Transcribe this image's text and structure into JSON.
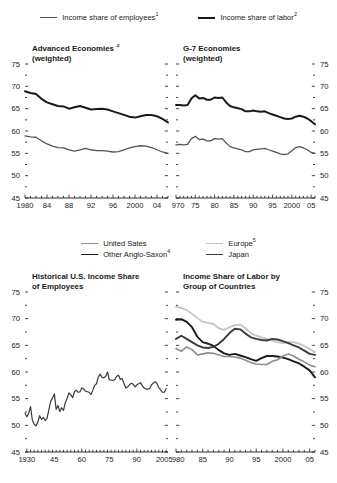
{
  "top_legend": {
    "items": [
      {
        "label": "Income share of employees",
        "sup": "1",
        "color": "#555555",
        "width": 1.3
      },
      {
        "label": "Income share of labor",
        "sup": "2",
        "color": "#1a1a1a",
        "width": 2.0
      }
    ]
  },
  "mid_legend": {
    "items": [
      {
        "label": "United Sates",
        "sup": "",
        "color": "#8c8c8c",
        "width": 1.5
      },
      {
        "label": "Other Anglo-Saxon",
        "sup": "4",
        "color": "#1a1a1a",
        "width": 1.9
      },
      {
        "label": "Europe",
        "sup": "5",
        "color": "#c4c4c4",
        "width": 1.7
      },
      {
        "label": "Japan",
        "sup": "",
        "color": "#3a3a3a",
        "width": 1.9
      }
    ]
  },
  "chart_data": [
    {
      "id": "advanced-economies",
      "type": "line",
      "title": "Advanced Economies",
      "title_sup": "3",
      "subtitle": "(weighted)",
      "labels_side": "left",
      "xlabel": "",
      "ylabel": "",
      "ylim": [
        45,
        75
      ],
      "yticks": [
        45,
        50,
        55,
        60,
        65,
        70,
        75
      ],
      "yticklabels": [
        "45",
        "50",
        "55",
        "60",
        "65",
        "70",
        "75"
      ],
      "yminor_step": 2.5,
      "xlim": [
        1980,
        2006
      ],
      "xticks": [
        1980,
        1984,
        1988,
        1992,
        1996,
        2000,
        2004
      ],
      "xticklabels": [
        "1980",
        "84",
        "88",
        "92",
        "96",
        "2000",
        "04"
      ],
      "xminor_step": 1,
      "grid": false,
      "series": [
        {
          "name": "Income share of labor",
          "color": "#1a1a1a",
          "width": 2.0,
          "x": [
            1980,
            1981,
            1982,
            1983,
            1984,
            1985,
            1986,
            1987,
            1988,
            1989,
            1990,
            1991,
            1992,
            1993,
            1994,
            1995,
            1996,
            1997,
            1998,
            1999,
            2000,
            2001,
            2002,
            2003,
            2004,
            2005,
            2006
          ],
          "values": [
            68.9,
            68.5,
            68.3,
            67.2,
            66.4,
            66.0,
            65.6,
            65.5,
            65.0,
            65.3,
            65.6,
            65.2,
            64.8,
            64.9,
            65.0,
            64.8,
            64.4,
            64.0,
            63.6,
            63.2,
            63.0,
            63.3,
            63.6,
            63.6,
            63.3,
            62.7,
            61.9
          ]
        },
        {
          "name": "Income share of employees",
          "color": "#555555",
          "width": 1.3,
          "x": [
            1980,
            1981,
            1982,
            1983,
            1984,
            1985,
            1986,
            1987,
            1988,
            1989,
            1990,
            1991,
            1992,
            1993,
            1994,
            1995,
            1996,
            1997,
            1998,
            1999,
            2000,
            2001,
            2002,
            2003,
            2004,
            2005,
            2006
          ],
          "values": [
            58.9,
            58.7,
            58.6,
            57.8,
            57.1,
            56.6,
            56.3,
            56.2,
            55.8,
            55.5,
            55.8,
            56.1,
            55.8,
            55.6,
            55.6,
            55.5,
            55.3,
            55.4,
            55.8,
            56.2,
            56.5,
            56.7,
            56.6,
            56.3,
            55.8,
            55.3,
            55.0
          ]
        }
      ]
    },
    {
      "id": "g7-economies",
      "type": "line",
      "title": "G-7 Economies",
      "title_sup": "",
      "subtitle": "(weighted)",
      "labels_side": "right",
      "xlabel": "",
      "ylabel": "",
      "ylim": [
        45,
        75
      ],
      "yticks": [
        45,
        50,
        55,
        60,
        65,
        70,
        75
      ],
      "yticklabels": [
        "45",
        "50",
        "55",
        "60",
        "65",
        "70",
        "75"
      ],
      "yminor_step": 2.5,
      "xlim": [
        1970,
        2006
      ],
      "xticks": [
        1970,
        1975,
        1980,
        1985,
        1990,
        1995,
        2000,
        2005
      ],
      "xticklabels": [
        "1970",
        "75",
        "80",
        "85",
        "90",
        "95",
        "2000",
        "05"
      ],
      "xminor_step": 1,
      "grid": false,
      "series": [
        {
          "name": "Income share of labor",
          "color": "#1a1a1a",
          "width": 2.0,
          "x": [
            1970,
            1971,
            1972,
            1973,
            1974,
            1975,
            1976,
            1977,
            1978,
            1979,
            1980,
            1981,
            1982,
            1983,
            1984,
            1985,
            1986,
            1987,
            1988,
            1989,
            1990,
            1991,
            1992,
            1993,
            1994,
            1995,
            1996,
            1997,
            1998,
            1999,
            2000,
            2001,
            2002,
            2003,
            2004,
            2005,
            2006
          ],
          "values": [
            65.8,
            65.8,
            65.7,
            65.8,
            67.3,
            68.0,
            67.3,
            67.4,
            67.0,
            67.0,
            67.5,
            67.4,
            67.5,
            66.4,
            65.6,
            65.3,
            65.1,
            64.9,
            64.4,
            64.4,
            64.6,
            64.4,
            64.3,
            64.4,
            64.0,
            63.7,
            63.4,
            63.1,
            62.8,
            62.7,
            62.8,
            63.2,
            63.4,
            63.2,
            62.8,
            62.2,
            61.5
          ]
        },
        {
          "name": "Income share of employees",
          "color": "#555555",
          "width": 1.3,
          "x": [
            1970,
            1971,
            1972,
            1973,
            1974,
            1975,
            1976,
            1977,
            1978,
            1979,
            1980,
            1981,
            1982,
            1983,
            1984,
            1985,
            1986,
            1987,
            1988,
            1989,
            1990,
            1991,
            1992,
            1993,
            1994,
            1995,
            1996,
            1997,
            1998,
            1999,
            2000,
            2001,
            2002,
            2003,
            2004,
            2005,
            2006
          ],
          "values": [
            56.9,
            57.0,
            56.9,
            57.0,
            58.3,
            58.8,
            58.1,
            58.2,
            57.8,
            57.8,
            58.3,
            58.2,
            58.3,
            57.3,
            56.5,
            56.2,
            56.0,
            55.8,
            55.4,
            55.4,
            55.8,
            55.9,
            56.0,
            56.1,
            55.8,
            55.5,
            55.2,
            54.9,
            54.7,
            54.9,
            55.6,
            56.3,
            56.5,
            56.2,
            55.8,
            55.2,
            55.0
          ]
        }
      ]
    },
    {
      "id": "historical-us-income-share",
      "type": "line",
      "title": "Historical U.S. Income Share",
      "title_sup": "",
      "subtitle": "of Employees",
      "labels_side": "left",
      "xlabel": "",
      "ylabel": "",
      "ylim": [
        45,
        75
      ],
      "yticks": [
        45,
        50,
        55,
        60,
        65,
        70,
        75
      ],
      "yticklabels": [
        "45",
        "50",
        "55",
        "60",
        "65",
        "70",
        "75"
      ],
      "yminor_step": 2.5,
      "xlim": [
        1929,
        2007
      ],
      "xticks": [
        1930,
        1945,
        1960,
        1975,
        1990,
        2005
      ],
      "xticklabels": [
        "1930",
        "45",
        "60",
        "75",
        "90",
        "2005"
      ],
      "xminor_step": 2,
      "grid": false,
      "series": [
        {
          "name": "Income share of employees",
          "color": "#3a3a3a",
          "width": 1.2,
          "x": [
            1929,
            1930,
            1931,
            1932,
            1933,
            1934,
            1935,
            1936,
            1937,
            1938,
            1939,
            1940,
            1941,
            1942,
            1943,
            1944,
            1945,
            1946,
            1947,
            1948,
            1949,
            1950,
            1951,
            1952,
            1953,
            1954,
            1955,
            1956,
            1957,
            1958,
            1959,
            1960,
            1961,
            1962,
            1963,
            1964,
            1965,
            1966,
            1967,
            1968,
            1969,
            1970,
            1971,
            1972,
            1973,
            1974,
            1975,
            1976,
            1977,
            1978,
            1979,
            1980,
            1981,
            1982,
            1983,
            1984,
            1985,
            1986,
            1987,
            1988,
            1989,
            1990,
            1991,
            1992,
            1993,
            1994,
            1995,
            1996,
            1997,
            1998,
            1999,
            2000,
            2001,
            2002,
            2003,
            2004,
            2005,
            2006
          ],
          "values": [
            52.3,
            51.6,
            52.2,
            53.5,
            51.0,
            50.2,
            49.9,
            50.6,
            51.8,
            51.1,
            51.5,
            50.9,
            51.3,
            52.9,
            54.5,
            55.1,
            55.9,
            53.0,
            53.7,
            52.6,
            53.3,
            52.8,
            54.3,
            55.1,
            56.1,
            55.7,
            55.2,
            56.3,
            56.6,
            56.2,
            56.3,
            57.0,
            56.8,
            56.4,
            56.3,
            56.2,
            55.8,
            56.6,
            57.5,
            57.8,
            59.1,
            59.6,
            59.0,
            58.9,
            59.2,
            60.0,
            58.5,
            58.5,
            58.4,
            58.6,
            59.2,
            59.4,
            58.6,
            58.8,
            57.8,
            57.0,
            57.2,
            57.6,
            57.9,
            57.7,
            57.2,
            57.6,
            57.8,
            58.0,
            57.4,
            57.0,
            56.8,
            56.8,
            56.9,
            57.6,
            57.9,
            58.2,
            57.8,
            57.1,
            56.6,
            56.2,
            56.2,
            56.9
          ]
        }
      ]
    },
    {
      "id": "income-share-labor-by-group",
      "type": "line",
      "title": "Income Share of Labor by",
      "title_sup": "",
      "subtitle": "Group of Countries",
      "labels_side": "right",
      "xlabel": "",
      "ylabel": "",
      "ylim": [
        45,
        75
      ],
      "yticks": [
        45,
        50,
        55,
        60,
        65,
        70,
        75
      ],
      "yticklabels": [
        "45",
        "50",
        "55",
        "60",
        "65",
        "70",
        "75"
      ],
      "yminor_step": 2.5,
      "xlim": [
        1980,
        2006
      ],
      "xticks": [
        1980,
        1985,
        1990,
        1995,
        2000,
        2005
      ],
      "xticklabels": [
        "1980",
        "85",
        "90",
        "95",
        "2000",
        "05"
      ],
      "xminor_step": 1,
      "grid": false,
      "series": [
        {
          "name": "Europe",
          "color": "#c4c4c4",
          "width": 1.8,
          "x": [
            1980,
            1981,
            1982,
            1983,
            1984,
            1985,
            1986,
            1987,
            1988,
            1989,
            1990,
            1991,
            1992,
            1993,
            1994,
            1995,
            1996,
            1997,
            1998,
            1999,
            2000,
            2001,
            2002,
            2003,
            2004,
            2005,
            2006
          ],
          "values": [
            72.2,
            72.0,
            71.6,
            70.9,
            70.1,
            69.4,
            69.2,
            69.0,
            68.2,
            67.9,
            68.4,
            68.8,
            68.9,
            68.2,
            67.3,
            66.8,
            66.5,
            66.2,
            65.9,
            65.6,
            65.4,
            65.6,
            65.6,
            65.3,
            64.9,
            64.3,
            63.7
          ]
        },
        {
          "name": "Other Anglo-Saxon",
          "color": "#1a1a1a",
          "width": 1.9,
          "x": [
            1980,
            1981,
            1982,
            1983,
            1984,
            1985,
            1986,
            1987,
            1988,
            1989,
            1990,
            1991,
            1992,
            1993,
            1994,
            1995,
            1996,
            1997,
            1998,
            1999,
            2000,
            2001,
            2002,
            2003,
            2004,
            2005,
            2006
          ],
          "values": [
            69.8,
            69.9,
            69.4,
            68.4,
            66.6,
            65.6,
            65.3,
            64.9,
            64.1,
            63.5,
            63.2,
            63.4,
            63.1,
            62.8,
            62.4,
            62.1,
            62.6,
            63.0,
            63.0,
            62.9,
            62.7,
            62.4,
            62.0,
            61.6,
            61.0,
            60.3,
            59.0
          ]
        },
        {
          "name": "Japan",
          "color": "#3a3a3a",
          "width": 1.9,
          "x": [
            1980,
            1981,
            1982,
            1983,
            1984,
            1985,
            1986,
            1987,
            1988,
            1989,
            1990,
            1991,
            1992,
            1993,
            1994,
            1995,
            1996,
            1997,
            1998,
            1999,
            2000,
            2001,
            2002,
            2003,
            2004,
            2005,
            2006
          ],
          "values": [
            66.2,
            66.8,
            66.2,
            65.6,
            65.0,
            64.6,
            64.5,
            64.7,
            65.3,
            66.2,
            67.3,
            68.1,
            68.0,
            67.2,
            66.5,
            66.2,
            66.0,
            65.9,
            66.2,
            66.1,
            65.8,
            65.4,
            65.0,
            64.6,
            64.0,
            63.4,
            63.2
          ]
        },
        {
          "name": "United Sates",
          "color": "#8c8c8c",
          "width": 1.6,
          "x": [
            1980,
            1981,
            1982,
            1983,
            1984,
            1985,
            1986,
            1987,
            1988,
            1989,
            1990,
            1991,
            1992,
            1993,
            1994,
            1995,
            1996,
            1997,
            1998,
            1999,
            2000,
            2001,
            2002,
            2003,
            2004,
            2005,
            2006
          ],
          "values": [
            64.4,
            63.9,
            64.7,
            64.2,
            63.2,
            63.4,
            63.6,
            63.5,
            63.2,
            62.9,
            62.9,
            62.8,
            62.6,
            62.2,
            61.8,
            61.5,
            61.4,
            61.4,
            62.0,
            62.3,
            63.0,
            63.4,
            63.0,
            62.4,
            61.9,
            61.3,
            61.0
          ]
        }
      ]
    }
  ]
}
